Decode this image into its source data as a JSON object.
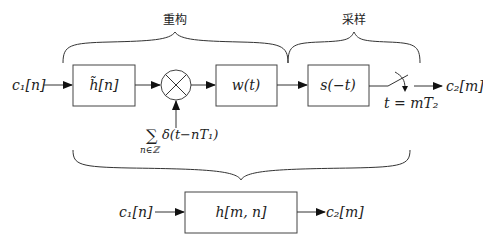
{
  "diagram": {
    "top_labels": {
      "reconstruction": "重构",
      "sampling": "采样"
    },
    "input_label": "c₁[n]",
    "output_label": "c₂[m]",
    "blocks": [
      {
        "id": "h_tilde",
        "label": "h̃[n]"
      },
      {
        "id": "multiplier",
        "label": "⊗"
      },
      {
        "id": "w",
        "label": "w(t)"
      },
      {
        "id": "s",
        "label": "s(−t)"
      }
    ],
    "impulse_train": {
      "sum_symbol": "∑",
      "subscript": "n∈ℤ",
      "expression": "δ(t−nT₁)"
    },
    "sampler_label": "t = mT₂",
    "equivalent": {
      "input_label": "c₁[n]",
      "block_label": "h[m, n]",
      "output_label": "c₂[m]"
    }
  }
}
